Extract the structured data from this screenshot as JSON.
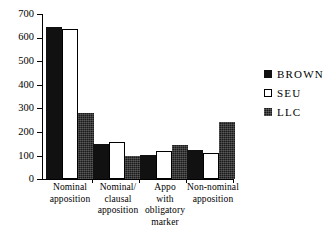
{
  "chart_data": {
    "type": "bar",
    "title": "",
    "xlabel": "",
    "ylabel": "",
    "ylim": [
      0,
      700
    ],
    "yticks": [
      0,
      100,
      200,
      300,
      400,
      500,
      600,
      700
    ],
    "grid": false,
    "legend_position": "right",
    "categories": [
      "Nominal apposition",
      "Nominal/ clausal apposition",
      "Appo with obligatory marker",
      "Non-nominal apposition"
    ],
    "category_lines": [
      [
        "Nominal",
        "apposition"
      ],
      [
        "Nominal/",
        "clausal",
        "apposition"
      ],
      [
        "Appo",
        "with",
        "obligatory",
        "marker"
      ],
      [
        "Non-nominal",
        "apposition"
      ]
    ],
    "series": [
      {
        "name": "BROWN",
        "color": "#111111",
        "fill": "solid-black",
        "values": [
          645,
          148,
          100,
          122
        ]
      },
      {
        "name": "SEU",
        "color": "#ffffff",
        "fill": "white-outline",
        "values": [
          637,
          158,
          120,
          110
        ]
      },
      {
        "name": "LLC",
        "color": "#1a1a1a",
        "fill": "dark-textured",
        "values": [
          280,
          98,
          145,
          240
        ]
      }
    ]
  },
  "legend": {
    "items": [
      {
        "label": "BROWN"
      },
      {
        "label": "SEU"
      },
      {
        "label": "LLC"
      }
    ]
  },
  "axis": {
    "y_labels": [
      "700",
      "600",
      "500",
      "400",
      "300",
      "200",
      "100",
      "0"
    ]
  }
}
